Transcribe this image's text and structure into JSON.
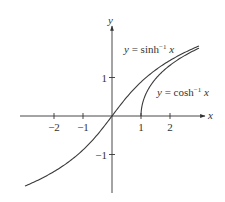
{
  "chart_data": {
    "type": "line",
    "title": "",
    "xlabel": "x",
    "ylabel": "y",
    "xlim": [
      -3.2,
      3.1
    ],
    "ylim": [
      -2.0,
      2.3
    ],
    "grid": false,
    "legend": "inline annotations",
    "x_ticks": [
      -2,
      -1,
      1,
      2
    ],
    "x_tick_labels": [
      "−2",
      "−1",
      "1",
      "2"
    ],
    "y_ticks": [
      1,
      -1
    ],
    "y_tick_labels": [
      "1",
      "−1"
    ],
    "series": [
      {
        "name": "y = sinh⁻¹ x",
        "function": "asinh",
        "x": [
          -3.0,
          -2.5,
          -2.0,
          -1.5,
          -1.0,
          -0.5,
          0.0,
          0.5,
          1.0,
          1.5,
          2.0,
          2.5,
          3.0
        ],
        "values": [
          -1.818,
          -1.647,
          -1.444,
          -1.195,
          -0.881,
          -0.481,
          0.0,
          0.481,
          0.881,
          1.195,
          1.444,
          1.647,
          1.818
        ]
      },
      {
        "name": "y = cosh⁻¹ x",
        "function": "acosh",
        "x": [
          1.0,
          1.05,
          1.1,
          1.25,
          1.5,
          2.0,
          2.5,
          3.0
        ],
        "values": [
          0.0,
          0.314,
          0.444,
          0.693,
          0.962,
          1.317,
          1.567,
          1.763
        ]
      }
    ],
    "annotations": [
      {
        "text_main": "y = sinh",
        "sup": "−1",
        "var": "x"
      },
      {
        "text_main": "y = cosh",
        "sup": "−1",
        "var": "x"
      }
    ]
  }
}
